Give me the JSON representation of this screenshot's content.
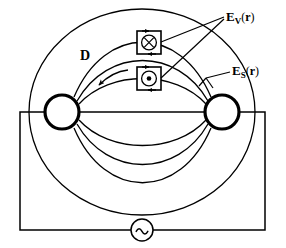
{
  "figure": {
    "type": "physics-circuit-field-diagram",
    "background_color": "#ffffff",
    "line_color": "#000000"
  },
  "labels": {
    "e_vector_volume": {
      "symbol": "E",
      "subscript": "V",
      "open_paren": "(",
      "argument": "r",
      "close_paren": ")",
      "full_text": "E_V (r)",
      "name": "induced-vector-field-label"
    },
    "e_vector_source": {
      "symbol": "E",
      "subscript": "S",
      "open_paren": "(",
      "argument": "r",
      "close_paren": ")",
      "full_text": "E_S (r)",
      "name": "source-field-label"
    },
    "displacement": {
      "symbol": "D",
      "full_text": "D",
      "name": "displacement-vector-label"
    }
  },
  "curl_boxes": [
    {
      "name": "curl-box-into-page",
      "glyph": "into-page",
      "description": "circle with cross, vector into page, enclosed by rectangular loop with arrowheads",
      "x": 149,
      "y": 42
    },
    {
      "name": "curl-box-out-of-page",
      "glyph": "out-of-page",
      "description": "circle with dot, vector out of page, enclosed by rectangular loop with arrowheads",
      "x": 149,
      "y": 78
    }
  ],
  "electrodes": [
    {
      "name": "left-electrode",
      "cx": 62,
      "cy": 112,
      "r": 18,
      "stroke_width": 3
    },
    {
      "name": "right-electrode",
      "cx": 222,
      "cy": 112,
      "r": 18,
      "stroke_width": 3
    }
  ],
  "ac_source": {
    "name": "ac-source",
    "symbol": "~",
    "cx": 142,
    "cy": 230,
    "r": 11
  },
  "circuit": {
    "name": "circuit-loop",
    "left_x": 20,
    "right_x": 265,
    "top_y": 112,
    "bottom_y": 230
  },
  "field_lines": {
    "outer_circle": {
      "cx": 142,
      "cy": 112,
      "rx": 113,
      "ry": 103
    },
    "arc_count": 8,
    "description": "nested arcs connecting the two electrodes, forming dipole-like field pattern"
  }
}
